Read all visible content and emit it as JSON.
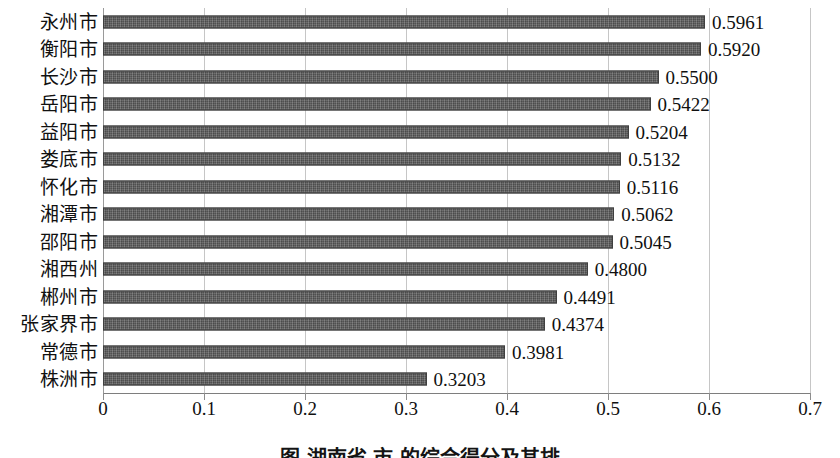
{
  "chart_data": {
    "type": "bar",
    "orientation": "horizontal",
    "title": "",
    "xlabel": "",
    "ylabel": "",
    "xlim": [
      0,
      0.7
    ],
    "xticks": [
      "0",
      "0.1",
      "0.2",
      "0.3",
      "0.4",
      "0.5",
      "0.6",
      "0.7"
    ],
    "xtick_values": [
      0,
      0.1,
      0.2,
      0.3,
      0.4,
      0.5,
      0.6,
      0.7
    ],
    "grid": "vertical",
    "legend": "none",
    "bar_color": "#5e5e5e",
    "bar_edge_color": "#3f3f3f",
    "gridline_color": "#c6c6c6",
    "categories": [
      "永州市",
      "衡阳市",
      "长沙市",
      "岳阳市",
      "益阳市",
      "娄底市",
      "怀化市",
      "湘潭市",
      "邵阳市",
      "湘西州",
      "郴州市",
      "张家界市",
      "常德市",
      "株洲市"
    ],
    "values": [
      0.5961,
      0.592,
      0.55,
      0.5422,
      0.5204,
      0.5132,
      0.5116,
      0.5062,
      0.5045,
      0.48,
      0.4491,
      0.4374,
      0.3981,
      0.3203
    ],
    "value_labels": [
      "0.5961",
      "0.5920",
      "0.5500",
      "0.5422",
      "0.5204",
      "0.5132",
      "0.5116",
      "0.5062",
      "0.5045",
      "0.4800",
      "0.4491",
      "0.4374",
      "0.3981",
      "0.3203"
    ]
  },
  "caption": {
    "text": "图 湖南省  市  的综合得分及其排"
  }
}
